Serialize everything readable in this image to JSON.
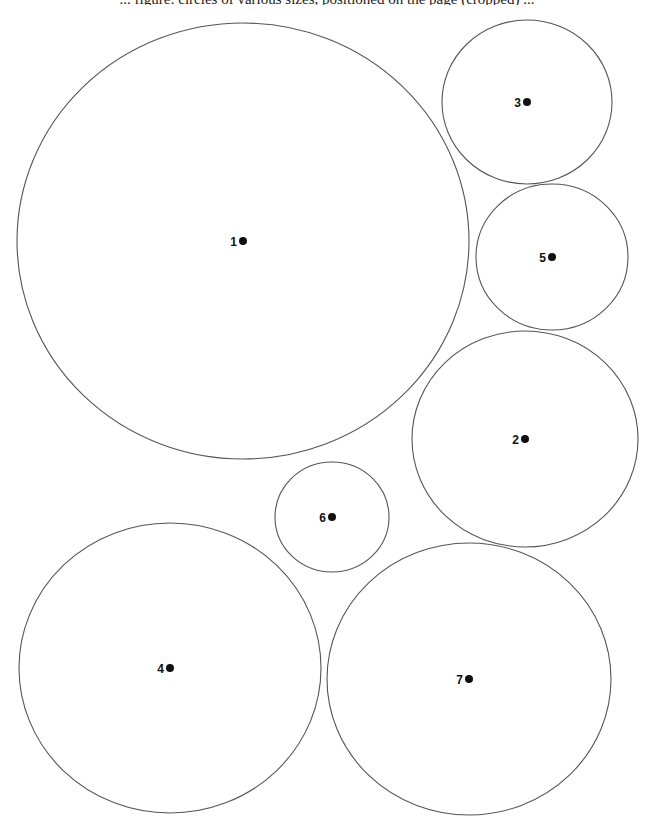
{
  "header": {
    "caption_partial": "... figure: circles of various sizes, positioned on the page (cropped) ..."
  },
  "diagram": {
    "type": "numbered circle layout",
    "stroke_color": "#555555",
    "dot_color": "#111111",
    "background": "#ffffff",
    "circles": [
      {
        "label": "1",
        "cx": 243,
        "cy": 241,
        "rx": 226,
        "ry": 218
      },
      {
        "label": "2",
        "cx": 525,
        "cy": 439,
        "rx": 113,
        "ry": 108
      },
      {
        "label": "3",
        "cx": 527,
        "cy": 102,
        "rx": 85,
        "ry": 82
      },
      {
        "label": "4",
        "cx": 170,
        "cy": 668,
        "rx": 151,
        "ry": 145
      },
      {
        "label": "5",
        "cx": 552,
        "cy": 257,
        "rx": 76,
        "ry": 73
      },
      {
        "label": "6",
        "cx": 332,
        "cy": 517,
        "rx": 57,
        "ry": 55
      },
      {
        "label": "7",
        "cx": 469,
        "cy": 679,
        "rx": 142,
        "ry": 136
      }
    ]
  }
}
